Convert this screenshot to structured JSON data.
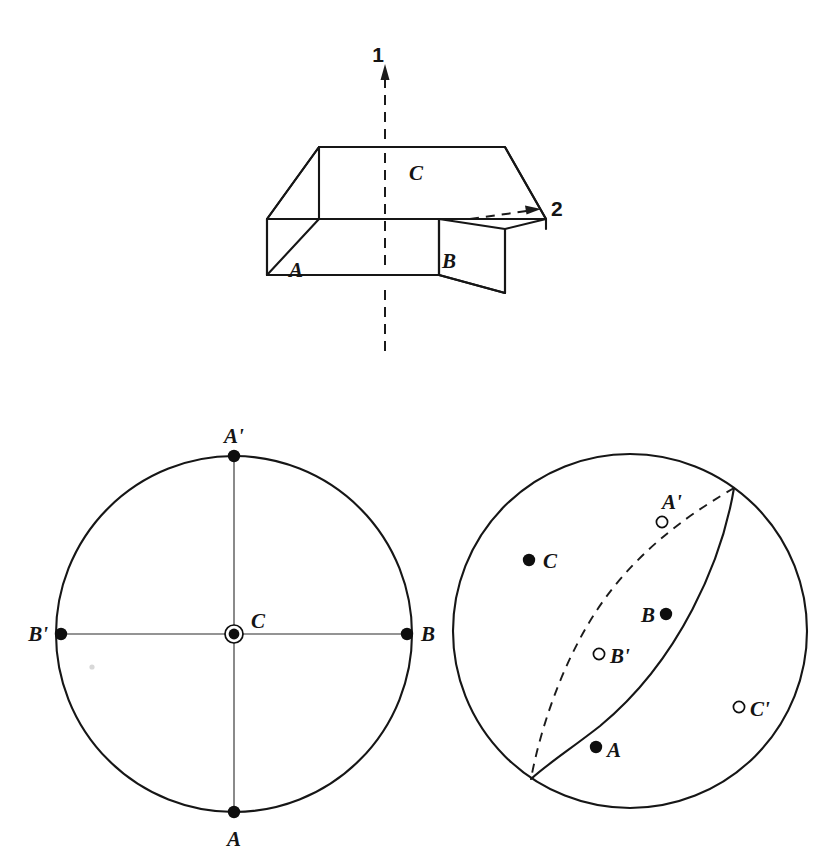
{
  "figure": {
    "kind": "crystallography-stereographic-projection",
    "caption": ""
  },
  "block_diagram": {
    "name": "orthorhombic-block",
    "axis_1_label": "1",
    "axis_2_label": "2",
    "face_labels": {
      "front_left": "A",
      "front_right": "B",
      "top": "C"
    }
  },
  "left_projection": {
    "title": "",
    "center_label": "C",
    "points": [
      {
        "id": "A-prime",
        "label": "A'",
        "type": "upper",
        "x": 234,
        "y": 456,
        "label_x": 234,
        "label_y": 443
      },
      {
        "id": "B",
        "label": "B",
        "type": "upper",
        "x": 407,
        "y": 634,
        "label_x": 423,
        "label_y": 632
      },
      {
        "id": "B-prime",
        "label": "B'",
        "type": "upper",
        "x": 61,
        "y": 634,
        "label_x": 41,
        "label_y": 632
      },
      {
        "id": "A",
        "label": "A",
        "type": "upper",
        "x": 234,
        "y": 812,
        "label_x": 234,
        "label_y": 840
      },
      {
        "id": "C",
        "label": "C",
        "type": "center-normal",
        "x": 234,
        "y": 634,
        "label_x": 252,
        "label_y": 620
      }
    ]
  },
  "right_projection": {
    "title": "",
    "points": [
      {
        "id": "A-prime",
        "label": "A'",
        "type": "lower",
        "x": 662,
        "y": 522,
        "label_x": 672,
        "label_y": 505
      },
      {
        "id": "C",
        "label": "C",
        "type": "upper",
        "x": 529,
        "y": 560,
        "label_x": 545,
        "label_y": 564
      },
      {
        "id": "B",
        "label": "B",
        "type": "upper",
        "x": 666,
        "y": 614,
        "label_x": 650,
        "label_y": 618
      },
      {
        "id": "B-prime",
        "label": "B'",
        "type": "lower",
        "x": 599,
        "y": 654,
        "label_x": 611,
        "label_y": 659
      },
      {
        "id": "C-prime",
        "label": "C'",
        "type": "lower",
        "x": 739,
        "y": 707,
        "label_x": 751,
        "label_y": 712
      },
      {
        "id": "A",
        "label": "A",
        "type": "upper",
        "x": 596,
        "y": 747,
        "label_x": 608,
        "label_y": 754
      }
    ],
    "great_circles": [
      {
        "id": "solid-great-circle",
        "style": "solid"
      },
      {
        "id": "dashed-great-circle",
        "style": "dashed"
      }
    ]
  },
  "legend": {
    "filled_marker_meaning": "upper hemisphere pole",
    "open_marker_meaning": "lower hemisphere pole"
  }
}
